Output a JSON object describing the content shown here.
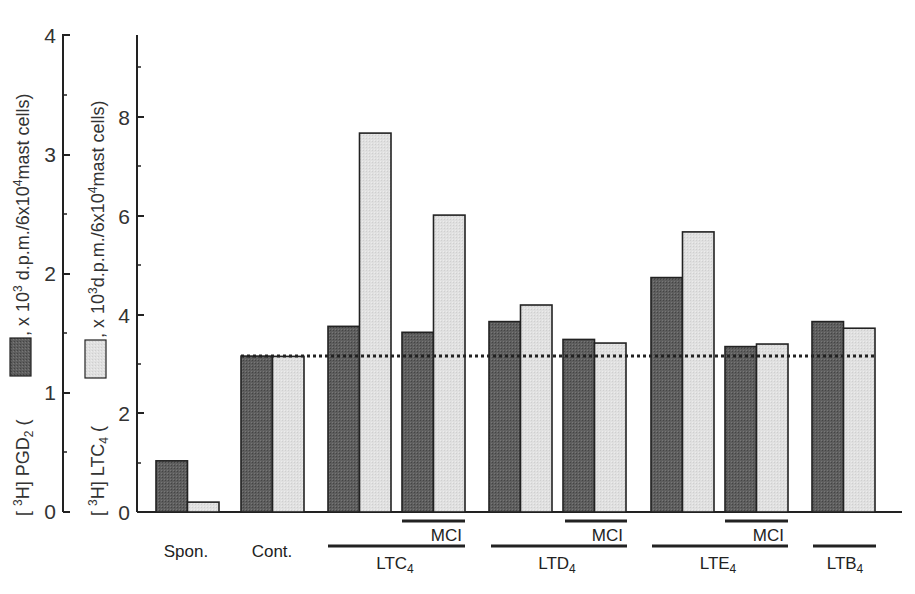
{
  "chart_data": {
    "type": "bar",
    "title": "",
    "categories": [
      "Spon.",
      "Cont.",
      "LTC4",
      "LTC4 + MCI",
      "LTD4",
      "LTD4 + MCI",
      "LTE4",
      "LTE4 + MCI",
      "LTB4"
    ],
    "series": [
      {
        "name": "[3H] PGD2",
        "axis": "left",
        "color": "#5a5a5a",
        "values": [
          0.43,
          1.31,
          1.56,
          1.51,
          1.6,
          1.45,
          1.97,
          1.39,
          1.6
        ]
      },
      {
        "name": "[3H] LTC4",
        "axis": "right",
        "color": "#dcdcdc",
        "values": [
          0.2,
          3.15,
          7.67,
          6.01,
          4.19,
          3.42,
          5.67,
          3.4,
          3.72
        ]
      }
    ],
    "left_axis": {
      "label": "[3H] PGD2 ( ■ , x 10^3 d.p.m./6x10^4 mast cells)",
      "ylim": [
        0,
        4
      ],
      "ticks": [
        0,
        1,
        2,
        3,
        4
      ],
      "tick_labels": [
        "0",
        "1",
        "2",
        "3",
        "4"
      ]
    },
    "right_axis": {
      "label": "[3H] LTC4 ( □ , x 10^3 d.p.m./6x10^4 mast cells)",
      "ylim": [
        0,
        9.6
      ],
      "ticks": [
        0,
        2,
        4,
        6,
        8
      ],
      "tick_labels": [
        "0",
        "2",
        "4",
        "6",
        "8"
      ]
    },
    "reference_line": {
      "style": "dotted",
      "value_left_axis": 1.31,
      "description": "control level"
    },
    "group_labels": [
      {
        "label": "Spon."
      },
      {
        "label": "Cont."
      },
      {
        "label": "LTC",
        "sub": "4",
        "mci": true
      },
      {
        "label": "LTD",
        "sub": "4",
        "mci": true
      },
      {
        "label": "LTE",
        "sub": "4",
        "mci": true
      },
      {
        "label": "LTB",
        "sub": "4",
        "mci": false
      }
    ],
    "mci_label": "MCI",
    "grid": false,
    "legend_position": "inline in y-axis labels"
  },
  "labels": {
    "spon": "Spon.",
    "cont": "Cont.",
    "mci": "MCI",
    "ltc": "LTC",
    "ltd": "LTD",
    "lte": "LTE",
    "ltb": "LTB",
    "sub4": "4",
    "left_axis_pre": "[ ",
    "left_axis_sup": "3",
    "left_axis_mid": "H] PGD",
    "left_axis_sub": "2",
    "left_axis_post": " , x 10",
    "left_axis_post_sup": "3",
    "left_axis_tail": " d.p.m./6x10",
    "left_axis_tail_sup": "4",
    "left_axis_end": "mast cells)",
    "right_axis_pre": "[ ",
    "right_axis_sup": "3",
    "right_axis_mid": "H] LTC",
    "right_axis_sub": "4",
    "right_axis_post": " , x 10",
    "right_axis_post_sup": "3",
    "right_axis_tail": "d.p.m./6x10",
    "right_axis_tail_sup": "4",
    "right_axis_end": "mast cells)",
    "left_ticks": [
      "0",
      "1",
      "2",
      "3",
      "4"
    ],
    "right_ticks": [
      "0",
      "2",
      "4",
      "6",
      "8"
    ]
  }
}
